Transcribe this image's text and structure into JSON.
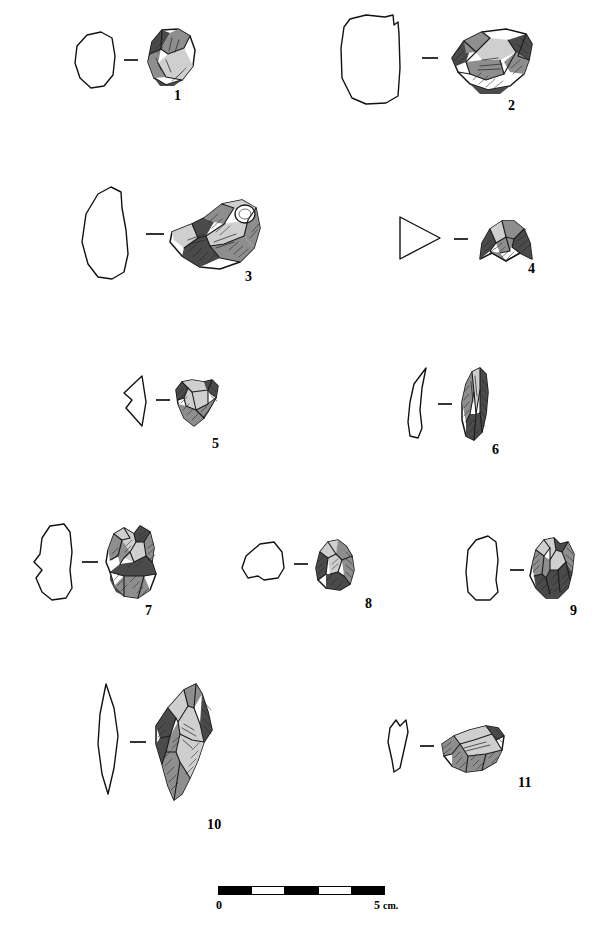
{
  "plate": {
    "kind": "archaeological-lithic-plate",
    "background_color": "#ffffff",
    "ink_color": "#000000",
    "width": 598,
    "height": 947,
    "connector_symbol": "—"
  },
  "figures": [
    {
      "id": 1,
      "label": "1",
      "description": "small flake core, sub-triangular, with cortical back",
      "section_shape": "rounded-hexagonal",
      "orientation": "vertical",
      "label_x": 174,
      "label_y": 89,
      "group_x": 62,
      "group_y": 18,
      "group_w": 150,
      "group_h": 80
    },
    {
      "id": 2,
      "label": "2",
      "description": "large horizontal discoidal core with heavy shading",
      "section_shape": "sub-rectangular",
      "orientation": "horizontal",
      "label_x": 508,
      "label_y": 99,
      "group_x": 330,
      "group_y": 8,
      "group_w": 200,
      "group_h": 100
    },
    {
      "id": 3,
      "label": "3",
      "description": "largest piece, broad flake with prominent bulb and cortex patch",
      "section_shape": "elongated-irregular",
      "orientation": "horizontal",
      "label_x": 245,
      "label_y": 270,
      "group_x": 64,
      "group_y": 178,
      "group_w": 200,
      "group_h": 105
    },
    {
      "id": 4,
      "label": "4",
      "description": "dome-shaped bifacial piece, triangular section",
      "section_shape": "triangular",
      "orientation": "horizontal",
      "label_x": 528,
      "label_y": 262,
      "group_x": 392,
      "group_y": 205,
      "group_w": 145,
      "group_h": 70
    },
    {
      "id": 5,
      "label": "5",
      "description": "notched / denticulate flake, triangular section",
      "section_shape": "triangular-concave",
      "orientation": "horizontal",
      "label_x": 212,
      "label_y": 437,
      "group_x": 112,
      "group_y": 368,
      "group_w": 115,
      "group_h": 65
    },
    {
      "id": 6,
      "label": "6",
      "description": "elongated blade / bladelet, narrow lenticular section",
      "section_shape": "narrow-curved",
      "orientation": "vertical",
      "label_x": 492,
      "label_y": 443,
      "group_x": 400,
      "group_y": 362,
      "group_w": 110,
      "group_h": 85
    },
    {
      "id": 7,
      "label": "7",
      "description": "multi-platform core with several flake scars, notched section",
      "section_shape": "irregular-notched",
      "orientation": "vertical",
      "label_x": 145,
      "label_y": 604,
      "group_x": 18,
      "group_y": 518,
      "group_w": 145,
      "group_h": 85
    },
    {
      "id": 8,
      "label": "8",
      "description": "small compact core, polygonal section",
      "section_shape": "polygonal",
      "orientation": "vertical",
      "label_x": 365,
      "label_y": 597,
      "group_x": 234,
      "group_y": 534,
      "group_w": 130,
      "group_h": 65
    },
    {
      "id": 9,
      "label": "9",
      "description": "faceted core with radial flake scars, rounded-rectangular section",
      "section_shape": "rounded-rectangular",
      "orientation": "vertical",
      "label_x": 570,
      "label_y": 604,
      "group_x": 452,
      "group_y": 528,
      "group_w": 125,
      "group_h": 80
    },
    {
      "id": 10,
      "label": "10",
      "description": "large elongated point / blade, lenticular section",
      "section_shape": "lenticular-elongated",
      "orientation": "vertical",
      "label_x": 207,
      "label_y": 818,
      "group_x": 80,
      "group_y": 678,
      "group_w": 145,
      "group_h": 130
    },
    {
      "id": 11,
      "label": "11",
      "description": "curved scraper-like flake, wedge-shaped section",
      "section_shape": "wedge",
      "orientation": "horizontal",
      "label_x": 518,
      "label_y": 776,
      "group_x": 374,
      "group_y": 712,
      "group_w": 140,
      "group_h": 70
    }
  ],
  "scale_bar": {
    "start_label": "0",
    "end_label": "5",
    "unit_label": "cm.",
    "total_cm": 5,
    "segments": 5,
    "segment_fills": [
      "filled",
      "empty",
      "filled",
      "empty",
      "filled"
    ],
    "x": 218,
    "y": 886,
    "width": 167,
    "height": 9
  }
}
